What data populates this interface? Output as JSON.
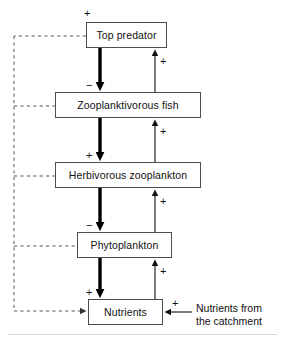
{
  "diagram": {
    "type": "flow-diagram",
    "nodes": [
      {
        "id": "top_predator",
        "label": "Top predator",
        "x": 86,
        "y": 22,
        "w": 81,
        "h": 26
      },
      {
        "id": "zooplanktivorous_fish",
        "label": "Zooplanktivorous fish",
        "x": 55,
        "y": 92,
        "w": 146,
        "h": 26
      },
      {
        "id": "herbivorous_zooplankton",
        "label": "Herbivorous zooplankton",
        "x": 55,
        "y": 162,
        "w": 146,
        "h": 26
      },
      {
        "id": "phytoplankton",
        "label": "Phytoplankton",
        "x": 77,
        "y": 232,
        "w": 95,
        "h": 26
      },
      {
        "id": "nutrients",
        "label": "Nutrients",
        "x": 88,
        "y": 299,
        "w": 75,
        "h": 26
      }
    ],
    "signs": [
      {
        "id": "sign-top-predator-input",
        "text": "+",
        "x": 84,
        "y": 8
      },
      {
        "id": "sign-predator-to-fish",
        "text": "−",
        "x": 86,
        "y": 80
      },
      {
        "id": "sign-fish-to-zooplankton",
        "text": "+",
        "x": 86,
        "y": 150
      },
      {
        "id": "sign-zooplankton-to-phyto",
        "text": "−",
        "x": 86,
        "y": 220
      },
      {
        "id": "sign-phyto-to-nutrients",
        "text": "+",
        "x": 86,
        "y": 287
      },
      {
        "id": "sign-fish-up-to-predator",
        "text": "+",
        "x": 160,
        "y": 56
      },
      {
        "id": "sign-zooplankton-up-to-fish",
        "text": "+",
        "x": 160,
        "y": 126
      },
      {
        "id": "sign-phyto-up-to-zooplankton",
        "text": "+",
        "x": 160,
        "y": 196
      },
      {
        "id": "sign-nutrients-up-to-phyto",
        "text": "+",
        "x": 160,
        "y": 266
      },
      {
        "id": "sign-catchment-input",
        "text": "+",
        "x": 172,
        "y": 298
      }
    ],
    "external_label": {
      "id": "nutrients-from-catchment",
      "line1": "Nutrients from",
      "line2": "the catchment",
      "x": 196,
      "y": 302
    },
    "thick_arrows": [
      {
        "id": "arrow-predator-to-fish",
        "x": 100,
        "y1": 48,
        "y2": 92
      },
      {
        "id": "arrow-fish-to-zooplankton",
        "x": 100,
        "y1": 118,
        "y2": 162
      },
      {
        "id": "arrow-zooplankton-to-phyto",
        "x": 100,
        "y1": 188,
        "y2": 232
      },
      {
        "id": "arrow-phyto-to-nutrients",
        "x": 100,
        "y1": 258,
        "y2": 299
      }
    ],
    "thin_arrows": [
      {
        "id": "arrow-fish-up-to-predator",
        "x": 155,
        "y1": 92,
        "y2": 48
      },
      {
        "id": "arrow-zooplankton-up-to-fish",
        "x": 155,
        "y1": 162,
        "y2": 118
      },
      {
        "id": "arrow-phyto-up-to-zooplankton",
        "x": 155,
        "y1": 232,
        "y2": 188
      },
      {
        "id": "arrow-nutrients-up-to-phyto",
        "x": 155,
        "y1": 299,
        "y2": 258
      }
    ],
    "colors": {
      "box_border": "#4d4d4d",
      "arrow": "#000000",
      "dashed": "#555555",
      "text": "#111111",
      "background": "#ffffff"
    }
  }
}
